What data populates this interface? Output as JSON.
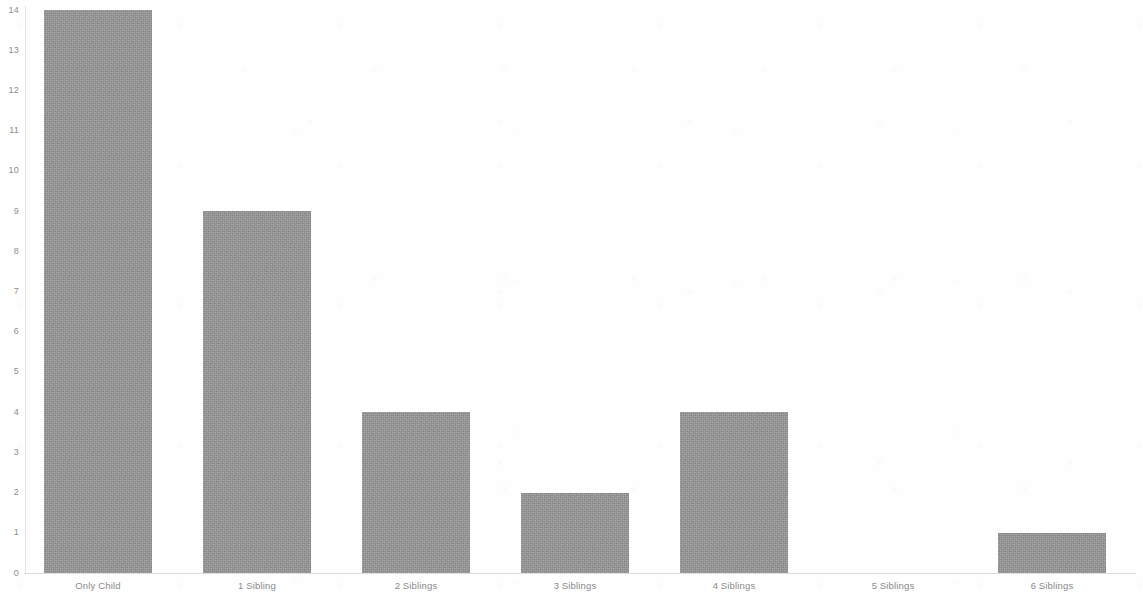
{
  "chart_data": {
    "type": "bar",
    "title": "",
    "subtitle": "",
    "xlabel": "",
    "ylabel": "",
    "categories": [
      "Only Child",
      "1 Sibling",
      "2 Siblings",
      "3 Siblings",
      "4 Siblings",
      "5 Siblings",
      "6 Siblings"
    ],
    "values": [
      14,
      9,
      4,
      2,
      4,
      0,
      1
    ],
    "ylim": [
      0,
      14
    ],
    "ytick_labels": [
      "0",
      "1",
      "2",
      "3",
      "4",
      "5",
      "6",
      "7",
      "8",
      "9",
      "10",
      "11",
      "12",
      "13",
      "14"
    ],
    "ytick_values": [
      0,
      1,
      2,
      3,
      4,
      5,
      6,
      7,
      8,
      9,
      10,
      11,
      12,
      13,
      14
    ],
    "grid": false,
    "legend": false,
    "legend_position": "none",
    "bar_color": "#949494",
    "axis_color": "#dcdcdc",
    "tick_label_color": "#8a8a8a",
    "background_color": "#fefefe"
  },
  "figure": {
    "plot_left_px": 25,
    "plot_top_px": 10,
    "plot_width_px": 1110,
    "plot_height_px": 563,
    "bar_width_px": 108,
    "bar_pitch_px": 159
  }
}
